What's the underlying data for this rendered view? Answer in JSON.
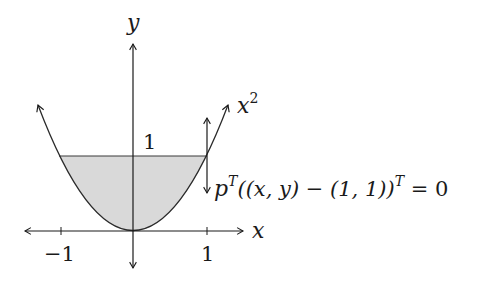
{
  "diagram": {
    "axes": {
      "x_label": "x",
      "y_label": "y",
      "x_ticks": [
        {
          "label": "−1",
          "value": -1
        },
        {
          "label": "1",
          "value": 1
        }
      ],
      "y_ticks": [
        {
          "label": "1",
          "value": 1
        }
      ]
    },
    "curve": {
      "label_base": "x",
      "label_sup": "2"
    },
    "constraint": {
      "p": "p",
      "sup1": "T",
      "middle": "((x, y) − (1, 1))",
      "sup2": "T",
      "tail": " = 0"
    },
    "colors": {
      "fill": "#d9d9d9",
      "stroke": "#1a1a1a"
    }
  }
}
